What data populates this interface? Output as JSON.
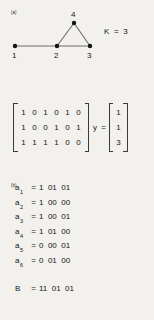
{
  "panels": {
    "a": {
      "label": "(a)"
    },
    "b": {
      "label": "(b)"
    },
    "c": {
      "label": "(c)"
    }
  },
  "graph": {
    "nodes": [
      {
        "id": "1",
        "label": "1",
        "x": 15,
        "y": 46
      },
      {
        "id": "2",
        "label": "2",
        "x": 57,
        "y": 46
      },
      {
        "id": "3",
        "label": "3",
        "x": 90,
        "y": 46
      },
      {
        "id": "4",
        "label": "4",
        "x": 74,
        "y": 23
      }
    ],
    "edges": [
      {
        "from": "1",
        "to": "2"
      },
      {
        "from": "2",
        "to": "3"
      },
      {
        "from": "2",
        "to": "4"
      },
      {
        "from": "3",
        "to": "4"
      }
    ],
    "k_label": "K  =  3",
    "node_color": "#141414",
    "edge_color": "#6e6e6e"
  },
  "matrix_equation": {
    "matrix": [
      [
        "1",
        "0",
        "1",
        "0",
        "1",
        "0"
      ],
      [
        "1",
        "0",
        "0",
        "1",
        "0",
        "1"
      ],
      [
        "1",
        "1",
        "1",
        "1",
        "0",
        "0"
      ]
    ],
    "operator": "y  =",
    "vector": [
      "1",
      "1",
      "3"
    ]
  },
  "codes": {
    "items": [
      {
        "symbol": "a",
        "subscript": "1",
        "equals": "=",
        "bits": "1  01  01"
      },
      {
        "symbol": "a",
        "subscript": "2",
        "equals": "=",
        "bits": "1  00  00"
      },
      {
        "symbol": "a",
        "subscript": "3",
        "equals": "=",
        "bits": "1  00  01"
      },
      {
        "symbol": "a",
        "subscript": "4",
        "equals": "=",
        "bits": "1  01  00"
      },
      {
        "symbol": "a",
        "subscript": "5",
        "equals": "=",
        "bits": "0  00  01"
      },
      {
        "symbol": "a",
        "subscript": "6",
        "equals": "=",
        "bits": "0  01  00"
      }
    ],
    "b_row": {
      "symbol": "B",
      "equals": "=",
      "bits": "11  01  01"
    }
  },
  "colors": {
    "background": "#f2f1ee",
    "ink": "#141414"
  }
}
